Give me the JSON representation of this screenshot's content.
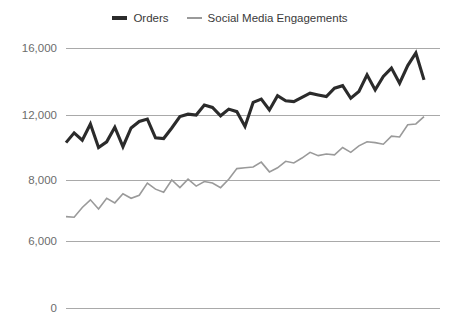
{
  "legend": {
    "position": "top-center",
    "items": [
      {
        "label": "Orders",
        "color": "#2b2b2b",
        "style": "thick-line"
      },
      {
        "label": "Social Media Engagements",
        "color": "#9a9a9a",
        "style": "thin-line"
      }
    ]
  },
  "axis": {
    "y_tick_labels": [
      "16,000",
      "12,000",
      "8,000",
      "6,000",
      "0"
    ],
    "y_tick_values": [
      16000,
      12000,
      8000,
      6000,
      0
    ],
    "y_tick_pixel_y": [
      48,
      115,
      180,
      241,
      308
    ],
    "grid": "horizontal-only",
    "x_tick_labels": []
  },
  "chart_data": {
    "type": "line",
    "title": "",
    "subtitle": "",
    "xlabel": "",
    "ylabel": "",
    "ylim": [
      0,
      16000
    ],
    "yticks": [
      0,
      6000,
      8000,
      12000,
      16000
    ],
    "ytick_labels": [
      "0",
      "6,000",
      "8,000",
      "12,000",
      "16,000"
    ],
    "ytick_scale": "non-linear-categorical",
    "grid": true,
    "legend_position": "top-center",
    "x": [
      1,
      2,
      3,
      4,
      5,
      6,
      7,
      8,
      9,
      10,
      11,
      12,
      13,
      14,
      15,
      16,
      17,
      18,
      19,
      20,
      21,
      22,
      23,
      24,
      25,
      26,
      27,
      28,
      29,
      30,
      31,
      32,
      33,
      34,
      35,
      36,
      37,
      38,
      39,
      40,
      41,
      42,
      43,
      44,
      45
    ],
    "series": [
      {
        "name": "Orders",
        "color": "#2b2b2b",
        "values": [
          10300,
          10900,
          10450,
          11450,
          10000,
          10350,
          11250,
          10050,
          11200,
          11600,
          11750,
          10600,
          10550,
          11200,
          11900,
          12050,
          12000,
          12600,
          12450,
          11950,
          12350,
          12200,
          11300,
          12750,
          12950,
          12300,
          13150,
          12850,
          12800,
          13050,
          13300,
          13200,
          13100,
          13600,
          13750,
          13000,
          13400,
          14400,
          13500,
          14300,
          14800,
          13900,
          14950,
          15700,
          14100
        ]
      },
      {
        "name": "Social Media Engagements",
        "color": "#9a9a9a",
        "values": [
          6800,
          6780,
          7100,
          7350,
          7050,
          7400,
          7250,
          7550,
          7400,
          7500,
          7900,
          7700,
          7600,
          8000,
          7750,
          8050,
          7800,
          7950,
          7900,
          7750,
          8050,
          8700,
          8750,
          8800,
          9100,
          8500,
          8750,
          9150,
          9050,
          9350,
          9700,
          9500,
          9600,
          9550,
          10000,
          9700,
          10100,
          10350,
          10300,
          10200,
          10700,
          10650,
          11400,
          11450,
          11900
        ]
      }
    ]
  },
  "colors": {
    "background": "#ffffff",
    "gridline": "#a9a9a9",
    "tick_text": "#6c6c6c",
    "legend_text": "#3a3a3a",
    "orders": "#2b2b2b",
    "social": "#9a9a9a"
  },
  "plot_geometry": {
    "left": 66,
    "right": 424,
    "grid_right": 440,
    "top": 48,
    "bottom": 308
  }
}
